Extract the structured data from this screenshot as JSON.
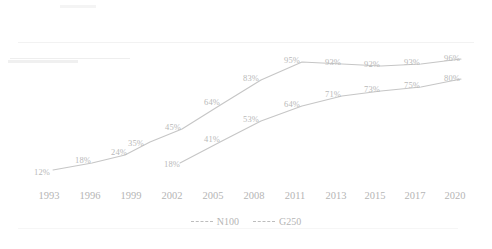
{
  "chart_data": {
    "type": "line",
    "title": "",
    "subtitle": "",
    "xlabel": "",
    "ylabel": "",
    "grid": false,
    "legend_position": "bottom-center",
    "ylim": [
      0,
      100
    ],
    "categories": [
      "1993",
      "1996",
      "1999",
      "2002",
      "2005",
      "2008",
      "2011",
      "2013",
      "2015",
      "2017",
      "2020"
    ],
    "series": [
      {
        "name": "N100",
        "color": "#c2c2c2",
        "linestyle": "solid",
        "x": [
          "1993",
          "1996",
          "1999",
          "2001",
          "2003",
          "2006",
          "2008",
          "2011",
          "2013",
          "2015",
          "2017",
          "2020"
        ],
        "values": [
          12,
          18,
          24,
          35,
          45,
          64,
          83,
          95,
          93,
          92,
          93,
          96
        ],
        "labels": [
          "12%",
          "18%",
          "24%",
          "35%",
          "45%",
          "64%",
          "83%",
          "95%",
          "93%",
          "92%",
          "93%",
          "96%"
        ]
      },
      {
        "name": "G250",
        "color": "#c2c2c2",
        "linestyle": "solid",
        "x": [
          "2002",
          "2005",
          "2008",
          "2011",
          "2013",
          "2015",
          "2017",
          "2020"
        ],
        "values": [
          18,
          41,
          53,
          64,
          71,
          73,
          75,
          80
        ],
        "labels": [
          "18%",
          "41%",
          "53%",
          "64%",
          "71%",
          "73%",
          "75%",
          "80%"
        ]
      }
    ]
  },
  "axis": {
    "ticks": [
      {
        "label": "1993",
        "x": 49
      },
      {
        "label": "1996",
        "x": 90
      },
      {
        "label": "1999",
        "x": 131
      },
      {
        "label": "2002",
        "x": 172
      },
      {
        "label": "2005",
        "x": 213
      },
      {
        "label": "2008",
        "x": 254
      },
      {
        "label": "2011",
        "x": 295
      },
      {
        "label": "2013",
        "x": 336
      },
      {
        "label": "2015",
        "x": 375
      },
      {
        "label": "2017",
        "x": 415
      },
      {
        "label": "2020",
        "x": 455
      }
    ]
  },
  "legend": {
    "items": [
      {
        "label": "N100"
      },
      {
        "label": "G250"
      }
    ]
  },
  "geometry": {
    "n100_points": [
      {
        "x": 53,
        "y": 170,
        "label": "12%",
        "lx": 42,
        "ly": 172
      },
      {
        "x": 92,
        "y": 163,
        "label": "18%",
        "lx": 83,
        "ly": 160
      },
      {
        "x": 125,
        "y": 155,
        "label": "24%",
        "lx": 119,
        "ly": 152
      },
      {
        "x": 150,
        "y": 142,
        "label": "35%",
        "lx": 136,
        "ly": 143
      },
      {
        "x": 182,
        "y": 129,
        "label": "45%",
        "lx": 173,
        "ly": 127
      },
      {
        "x": 222,
        "y": 104,
        "label": "64%",
        "lx": 212,
        "ly": 102
      },
      {
        "x": 261,
        "y": 80,
        "label": "83%",
        "lx": 251,
        "ly": 78
      },
      {
        "x": 302,
        "y": 62,
        "label": "95%",
        "lx": 292,
        "ly": 60
      },
      {
        "x": 342,
        "y": 64,
        "label": "93%",
        "lx": 333,
        "ly": 62
      },
      {
        "x": 381,
        "y": 66,
        "label": "92%",
        "lx": 372,
        "ly": 64
      },
      {
        "x": 421,
        "y": 64,
        "label": "93%",
        "lx": 412,
        "ly": 62
      },
      {
        "x": 461,
        "y": 59,
        "label": "96%",
        "lx": 452,
        "ly": 58
      }
    ],
    "g250_points": [
      {
        "x": 180,
        "y": 163,
        "label": "18%",
        "lx": 172,
        "ly": 164
      },
      {
        "x": 222,
        "y": 141,
        "label": "41%",
        "lx": 212,
        "ly": 139
      },
      {
        "x": 261,
        "y": 121,
        "label": "53%",
        "lx": 251,
        "ly": 119
      },
      {
        "x": 302,
        "y": 106,
        "label": "64%",
        "lx": 292,
        "ly": 104
      },
      {
        "x": 342,
        "y": 96,
        "label": "71%",
        "lx": 333,
        "ly": 94
      },
      {
        "x": 381,
        "y": 91,
        "label": "73%",
        "lx": 372,
        "ly": 89
      },
      {
        "x": 421,
        "y": 87,
        "label": "75%",
        "lx": 412,
        "ly": 85
      },
      {
        "x": 461,
        "y": 79,
        "label": "80%",
        "lx": 452,
        "ly": 78
      }
    ]
  }
}
